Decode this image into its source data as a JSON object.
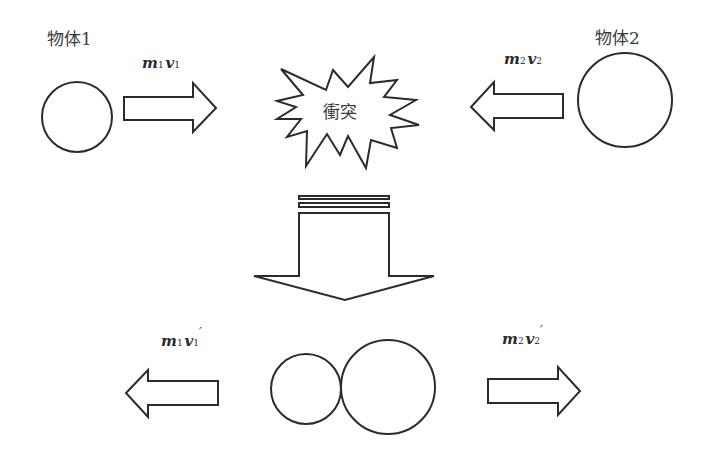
{
  "diagram": {
    "type": "collision-momentum",
    "before": {
      "object1": {
        "label": "物体1",
        "momentum": {
          "m": "m",
          "sub_m": "1",
          "v": "v",
          "sub_v": "1",
          "prime": ""
        },
        "direction": "right"
      },
      "object2": {
        "label": "物体2",
        "momentum": {
          "m": "m",
          "sub_m": "2",
          "v": "v",
          "sub_v": "2",
          "prime": ""
        },
        "direction": "left"
      },
      "collision_label": "衝突"
    },
    "transition": {
      "arrow": "down"
    },
    "after": {
      "object1": {
        "momentum": {
          "m": "m",
          "sub_m": "1",
          "v": "v",
          "sub_v": "1",
          "prime": "′"
        },
        "direction": "left"
      },
      "object2": {
        "momentum": {
          "m": "m",
          "sub_m": "2",
          "v": "v",
          "sub_v": "2",
          "prime": "′"
        },
        "direction": "right"
      }
    },
    "colors": {
      "stroke": "#2b2b2b",
      "fill": "#ffffff",
      "text": "#3a3a3a"
    }
  }
}
